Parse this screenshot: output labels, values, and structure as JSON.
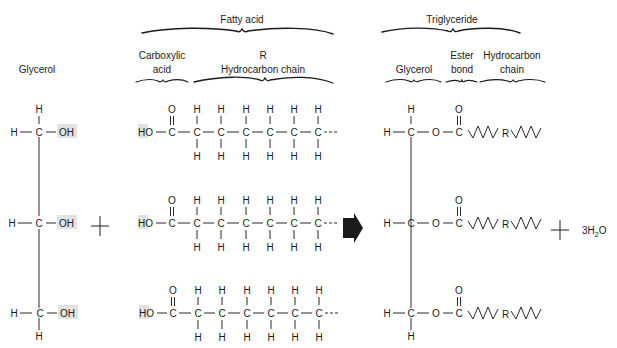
{
  "headers": {
    "fatty_acid": "Fatty acid",
    "triglyceride": "Triglyceride"
  },
  "subheaders": {
    "glycerol_left": "Glycerol",
    "carboxylic_line1": "Carboxylic",
    "carboxylic_line2": "acid",
    "r_label": "R",
    "hydrocarbon_chain_left": "Hydrocarbon chain",
    "glycerol_right": "Glycerol",
    "ester_line1": "Ester",
    "ester_line2": "bond",
    "hydrocarbon_line1": "Hydrocarbon",
    "hydrocarbon_line2": "chain"
  },
  "atoms": {
    "H": "H",
    "C": "C",
    "O": "O",
    "OH": "OH",
    "HO": "HO",
    "R": "R",
    "dash_tail": "---"
  },
  "reaction": {
    "plus_left": "+",
    "plus_right": "+",
    "arrow": "right-arrow",
    "product_water_coef": "3",
    "product_water_H": "H",
    "product_water_sub": "2",
    "product_water_O": "O"
  },
  "structure": {
    "glycerol_rows_y": [
      132,
      223,
      313
    ],
    "fatty_acid_rows_y": [
      132,
      223,
      313
    ],
    "fatty_acid_chain_carbons": 6,
    "triglyceride_rows_y": [
      132,
      223,
      313
    ]
  },
  "colors": {
    "ink": "#1a1a1a",
    "highlight": "#e2e2e2",
    "background": "#ffffff"
  }
}
